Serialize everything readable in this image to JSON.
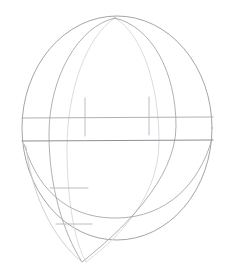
{
  "document": {
    "title": "Sphere construction line drawing",
    "kind": "technical-line-drawing",
    "background_color": "#ffffff",
    "canvas": {
      "width": 227,
      "height": 278
    }
  },
  "palette": {
    "outline_gray": "#9a9a9f",
    "mid_gray": "#a8a8ad",
    "light_gray": "#c9c9cf",
    "faint_gray": "#dcdce0",
    "tick_gray": "#b4b4ba",
    "equator_gray": "#8f8f95"
  },
  "geometry": {
    "outer_circle": {
      "name": "outer-sphere-circle",
      "center_x": 117,
      "center_y": 128,
      "radius_x": 95,
      "radius_y": 112,
      "stroke": "#9a9a9f",
      "stroke_width": 0.9
    },
    "vertical_meridian_ellipse": {
      "name": "vertical-meridian-ellipse",
      "center_x": 113,
      "center_y": 140,
      "radius_x": 46,
      "radius_y": 122,
      "stroke": "#dcdce0",
      "stroke_width": 0.9
    },
    "egg_outline": {
      "name": "egg-teardrop-outline",
      "apex_x": 115,
      "apex_y": 18,
      "bottom_x": 82,
      "bottom_y": 262,
      "left_bulge_x": 48,
      "right_bulge_x": 176,
      "stroke": "#a8a8ad",
      "stroke_width": 0.9
    },
    "bowl_arc": {
      "name": "bowl-base-arc",
      "left_x": 24,
      "left_y": 145,
      "right_x": 212,
      "right_y": 140,
      "low_x": 118,
      "low_y": 218,
      "stroke": "#a8a8ad",
      "stroke_width": 0.9
    },
    "inner_slant_arc": {
      "name": "inner-slant-arc",
      "start_x": 26,
      "start_y": 146,
      "end_x": 82,
      "end_y": 262,
      "stroke": "#c9c9cf",
      "stroke_width": 0.9
    },
    "equator_line_upper": {
      "name": "equator-line-upper",
      "x1": 22,
      "y1": 118,
      "x2": 213,
      "y2": 117,
      "stroke": "#a8a8ad",
      "stroke_width": 0.9
    },
    "equator_line_lower": {
      "name": "equator-line-lower",
      "x1": 22,
      "y1": 141,
      "x2": 213,
      "y2": 140,
      "stroke": "#8f8f95",
      "stroke_width": 1.1
    },
    "tick_marks": [
      {
        "name": "tick-vertical-left",
        "orientation": "vertical",
        "x1": 85,
        "y1": 98,
        "x2": 85,
        "y2": 136
      },
      {
        "name": "tick-vertical-right",
        "orientation": "vertical",
        "x1": 149,
        "y1": 97,
        "x2": 149,
        "y2": 135
      },
      {
        "name": "tick-horizontal-upper-lower-left",
        "orientation": "horizontal",
        "x1": 50,
        "y1": 188,
        "x2": 88,
        "y2": 188
      },
      {
        "name": "tick-horizontal-lower-lower-left",
        "orientation": "horizontal",
        "x1": 56,
        "y1": 224,
        "x2": 92,
        "y2": 224
      }
    ]
  }
}
